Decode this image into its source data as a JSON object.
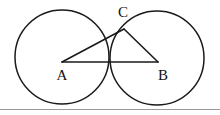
{
  "figure": {
    "background_color": "#ffffff",
    "stroke_color": "#1a1a1a",
    "frame_color": "#9a9a9a",
    "width": 220,
    "height": 115
  },
  "labels": {
    "a": "A",
    "b": "B",
    "c": "C"
  },
  "geometry": {
    "circle_left": {
      "cx": 62,
      "cy": 57,
      "r": 47
    },
    "circle_right": {
      "cx": 157,
      "cy": 58,
      "r": 47
    },
    "point_a": {
      "x": 62,
      "y": 62
    },
    "point_b": {
      "x": 158,
      "y": 62
    },
    "point_c": {
      "x": 124,
      "y": 29
    },
    "label_a_pos": {
      "x": 62,
      "y": 80
    },
    "label_b_pos": {
      "x": 163,
      "y": 80
    },
    "label_c_pos": {
      "x": 123,
      "y": 17
    },
    "segments": [
      {
        "name": "AB",
        "from": "point_a",
        "to": "point_b"
      },
      {
        "name": "AC",
        "from": "point_a",
        "to": "point_c"
      },
      {
        "name": "CB",
        "from": "point_c",
        "to": "point_b"
      }
    ],
    "frame_bottom_y": 109
  }
}
